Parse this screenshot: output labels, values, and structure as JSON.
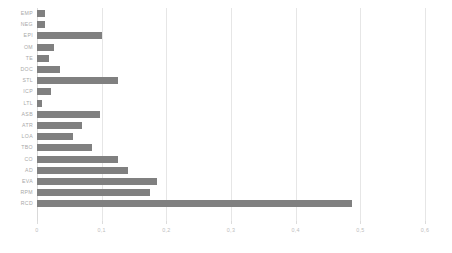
{
  "chart_data": {
    "type": "bar",
    "orientation": "horizontal",
    "title": "",
    "xlabel": "",
    "ylabel": "",
    "xlim": [
      0,
      0.6
    ],
    "grid": true,
    "legend": false,
    "decimal_separator": ",",
    "bar_color": "#808080",
    "gridline_color": "#e6e6e6",
    "label_color": "#a8a8a8",
    "x_ticks": [
      0,
      0.1,
      0.2,
      0.3,
      0.4,
      0.5,
      0.6
    ],
    "x_tick_labels": [
      "0",
      "0,1",
      "0,2",
      "0,3",
      "0,4",
      "0,5",
      "0,6"
    ],
    "categories": [
      "EMP",
      "NEG",
      "EPI",
      "OM",
      "TE",
      "DOC",
      "STL",
      "ICP",
      "LTL",
      "ASB",
      "ATR",
      "LOA",
      "TBO",
      "CO",
      "AD",
      "EVA",
      "RPM",
      "RCD"
    ],
    "values": [
      0.012,
      0.013,
      0.1,
      0.027,
      0.018,
      0.035,
      0.125,
      0.022,
      0.008,
      0.098,
      0.07,
      0.055,
      0.085,
      0.125,
      0.14,
      0.185,
      0.175,
      0.487
    ]
  }
}
